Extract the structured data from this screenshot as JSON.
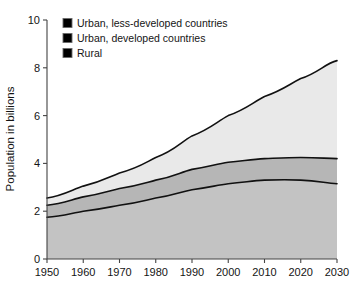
{
  "figure": {
    "title": "",
    "background": "#ffffff"
  },
  "axes": {
    "y": {
      "label": "Population in billions",
      "ticks": [
        "0",
        "2",
        "4",
        "6",
        "8",
        "10"
      ],
      "min": 0,
      "max": 10
    },
    "x": {
      "label": "",
      "ticks": [
        "1950",
        "1960",
        "1970",
        "1980",
        "1990",
        "2000",
        "2010",
        "2020",
        "2030"
      ],
      "min": 1950,
      "max": 2030
    }
  },
  "legend": {
    "position": "top-left-inside",
    "items": [
      {
        "label": "Urban, less-developed countries",
        "color": "#e9e9e9"
      },
      {
        "label": "Urban, developed countries",
        "color": "#b6b6b6"
      },
      {
        "label": "Rural",
        "color": "#c3c3c3"
      }
    ]
  },
  "chart_data": {
    "type": "area",
    "stacked": true,
    "title": "",
    "xlabel": "",
    "ylabel": "Population in billions",
    "xlim": [
      1950,
      2030
    ],
    "ylim": [
      0,
      10
    ],
    "grid": false,
    "legend_position": "top-left-inside",
    "x": [
      1950,
      1960,
      1970,
      1980,
      1990,
      2000,
      2010,
      2020,
      2030
    ],
    "series": [
      {
        "name": "Rural",
        "color": "#c3c3c3",
        "values": [
          1.75,
          2.0,
          2.25,
          2.55,
          2.9,
          3.15,
          3.3,
          3.3,
          3.15
        ],
        "cumulative": [
          1.75,
          2.0,
          2.25,
          2.55,
          2.9,
          3.15,
          3.3,
          3.3,
          3.15
        ]
      },
      {
        "name": "Urban, developed countries",
        "color": "#b6b6b6",
        "values": [
          0.5,
          0.6,
          0.7,
          0.75,
          0.85,
          0.9,
          0.95,
          0.95,
          1.05
        ],
        "cumulative": [
          2.25,
          2.6,
          2.95,
          3.3,
          3.75,
          4.05,
          4.2,
          4.25,
          4.2
        ]
      },
      {
        "name": "Urban, less-developed countries",
        "color": "#e9e9e9",
        "values": [
          0.3,
          0.45,
          0.65,
          0.95,
          1.4,
          1.95,
          2.6,
          3.3,
          4.1
        ],
        "cumulative": [
          2.55,
          3.05,
          3.6,
          4.25,
          5.15,
          6.0,
          6.8,
          7.55,
          8.3
        ]
      }
    ],
    "annotations": []
  },
  "geometry": {
    "plot_left": 47,
    "plot_right": 337,
    "plot_top": 20,
    "plot_bottom": 259
  }
}
